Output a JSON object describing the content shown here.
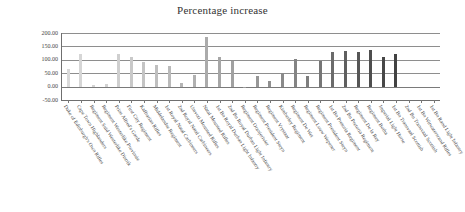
{
  "chart_data": {
    "type": "bar",
    "title": "Percentage increase",
    "xlabel": "",
    "ylabel": "",
    "ylim": [
      -50,
      200
    ],
    "grid": true,
    "legend": "none",
    "yticks": [
      "200.00",
      "150.00",
      "100.00",
      "50.00",
      "0.00",
      "-50.00"
    ],
    "ytick_values": [
      200,
      150,
      100,
      50,
      0,
      -50
    ],
    "categories": [
      "Duke of Edinburgh's Own Rifles",
      "Cape Town Highlanders",
      "Regiment Suid Westerlike Distrik",
      "Regiment Westerlike Provinsie",
      "Prins Alfred's Garde",
      "First City Regiment",
      "Kaffrarian Rifles",
      "Middelandse Regiment",
      "1st Royal Natal Carbineers",
      "2nd Royal Natal Carbineers",
      "Umvoti Mounted Rifles",
      "Natal Mounted Rifles",
      "1st Bn Royal Durban Light Infantry",
      "2nd Bn Royal Durban Light Infantry",
      "Regiment Oranjerivier",
      "Regiment President Steyn",
      "Regiment Vrystaat",
      "Kimberley Regiment",
      "Regiment De Wet",
      "Regiment Louw Wepener",
      "Regiment President Steyn",
      "1st Bn Pretoria Regiment",
      "2nd Bn Pretoria Regiment",
      "Regiment De la Rey",
      "Regiment Botha",
      "Imperial Light Horse",
      "1st Bn Transvaal Scottish",
      "2nd Bn Transvaal Scottish",
      "1st Bn Witwatersrand Rifles",
      "1st Bn Rand Light Infantry"
    ],
    "values": [
      65,
      120,
      5,
      8,
      122,
      112,
      92,
      79,
      77,
      13,
      45,
      185,
      112,
      94,
      -5,
      40,
      22,
      52,
      104,
      39,
      95,
      130,
      132,
      128,
      136,
      109,
      122,
      0,
      0,
      0
    ],
    "bar_colors": [
      "#d9d9d9",
      "#d6d6d6",
      "#d4d4d4",
      "#d2d2d2",
      "#cfcfcf",
      "#c9c9c9",
      "#c4c4c4",
      "#bfbfbf",
      "#bababa",
      "#b5b5b5",
      "#b0b0b0",
      "#ababab",
      "#a6a6a6",
      "#a1a1a1",
      "#9c9c9c",
      "#979797",
      "#909090",
      "#8a8a8a",
      "#848484",
      "#7e7e7e",
      "#767676",
      "#6b6b6b",
      "#5f5f5f",
      "#565656",
      "#4e4e4e",
      "#474747",
      "#424242",
      "#3e3e3e",
      "#3a3a3a",
      "#383838"
    ]
  }
}
